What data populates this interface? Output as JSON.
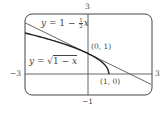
{
  "chart_data": {
    "type": "line",
    "title": "",
    "xlabel": "",
    "ylabel": "",
    "xlim": [
      -3,
      3
    ],
    "ylim": [
      -1,
      3
    ],
    "grid": false,
    "legend": "inline labels",
    "axis_labels": {
      "x_min": "−3",
      "x_max": "3",
      "y_min": "−1",
      "y_max": "3"
    },
    "series": [
      {
        "name": "y = 1 − ½x",
        "function": "1 - x/2",
        "x": [
          -3,
          -2,
          -1,
          0,
          1,
          2,
          3
        ],
        "values": [
          2.5,
          2,
          1.5,
          1,
          0.5,
          0,
          -0.5
        ]
      },
      {
        "name": "y = √(1 − x)",
        "function": "sqrt(1 - x)",
        "x": [
          -3,
          -2,
          -1,
          0,
          0.5,
          0.9,
          1
        ],
        "values": [
          2,
          1.732,
          1.414,
          1,
          0.707,
          0.316,
          0
        ]
      }
    ],
    "annotations": [
      {
        "text": "(0, 1)",
        "x": 0,
        "y": 1
      },
      {
        "text": "(1, 0)",
        "x": 1,
        "y": 0
      }
    ]
  },
  "labels": {
    "tangent": {
      "y": "y",
      "eq": " = 1 − ",
      "num": "1",
      "den": "2",
      "x": "x"
    },
    "curve": {
      "y": "y",
      "eq": " = ",
      "radical": "√",
      "inner_a": "1 − ",
      "inner_x": "x"
    },
    "point_a": "(0, 1)",
    "point_b": "(1, 0)",
    "tick_top": "3",
    "tick_bottom": "−1",
    "tick_left": "−3",
    "tick_right": "3"
  }
}
